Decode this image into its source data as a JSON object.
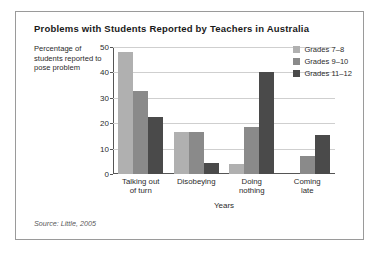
{
  "figure": {
    "title": "Problems with Students Reported by Teachers in Australia",
    "y_axis_label": "Percentage of students reported to pose problem",
    "source": "Source: Little, 2005"
  },
  "chart_data": {
    "type": "bar",
    "title": "Problems with Students Reported by Teachers in Australia",
    "xlabel": "Years",
    "ylabel": "Percentage of students reported to pose problem",
    "categories": [
      "Talking out of turn",
      "Disobeying",
      "Doing nothing",
      "Coming late"
    ],
    "ylim": [
      0,
      50
    ],
    "yticks": [
      0,
      10,
      20,
      30,
      40,
      50
    ],
    "grid": true,
    "legend_position": "top-right",
    "series": [
      {
        "name": "Grades 7–8",
        "color": "#b0b0b0",
        "values": [
          48,
          16.5,
          4,
          0
        ]
      },
      {
        "name": "Grades 9–10",
        "color": "#8a8a8a",
        "values": [
          32.5,
          16.5,
          18.5,
          7
        ]
      },
      {
        "name": "Grades 11–12",
        "color": "#4a4a4a",
        "values": [
          22.5,
          4.5,
          40,
          15.5
        ]
      }
    ]
  }
}
